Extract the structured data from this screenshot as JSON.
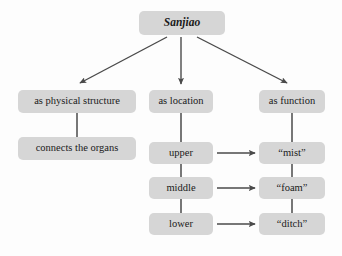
{
  "diagram": {
    "title": "Sanjiao",
    "root": {
      "id": "root",
      "label": "Sanjiao"
    },
    "columns": [
      {
        "id": "physical",
        "heading": "as physical structure",
        "items": [
          {
            "id": "connects",
            "label": "connects the organs"
          }
        ]
      },
      {
        "id": "location",
        "heading": "as location",
        "items": [
          {
            "id": "upper",
            "label": "upper"
          },
          {
            "id": "middle",
            "label": "middle"
          },
          {
            "id": "lower",
            "label": "lower"
          }
        ]
      },
      {
        "id": "function",
        "heading": "as function",
        "items": [
          {
            "id": "mist",
            "label": "“mist”"
          },
          {
            "id": "foam",
            "label": "“foam”"
          },
          {
            "id": "ditch",
            "label": "“ditch”"
          }
        ]
      }
    ],
    "edges": [
      {
        "from": "root",
        "to": "physical",
        "style": "arrow"
      },
      {
        "from": "root",
        "to": "location",
        "style": "arrow"
      },
      {
        "from": "root",
        "to": "function",
        "style": "arrow"
      },
      {
        "from": "physical",
        "to": "connects",
        "style": "line"
      },
      {
        "from": "location",
        "to": "upper",
        "style": "line"
      },
      {
        "from": "upper",
        "to": "middle",
        "style": "line"
      },
      {
        "from": "middle",
        "to": "lower",
        "style": "line"
      },
      {
        "from": "function",
        "to": "mist",
        "style": "line"
      },
      {
        "from": "mist",
        "to": "foam",
        "style": "line"
      },
      {
        "from": "foam",
        "to": "ditch",
        "style": "line"
      },
      {
        "from": "upper",
        "to": "mist",
        "style": "arrow"
      },
      {
        "from": "middle",
        "to": "foam",
        "style": "arrow"
      },
      {
        "from": "lower",
        "to": "ditch",
        "style": "arrow"
      }
    ],
    "colors": {
      "node_fill": "#d6d6d6",
      "text": "#1a1a1a",
      "edge": "#4a4a4a",
      "background": "#fdfdfd"
    }
  }
}
